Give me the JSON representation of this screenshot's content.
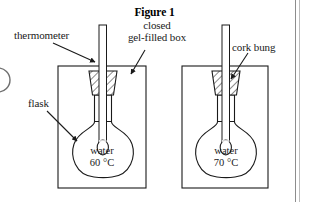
{
  "figure": {
    "title": "Figure 1",
    "type": "science-apparatus-diagram"
  },
  "labels": {
    "thermometer": "thermometer",
    "gel_box_line1": "closed",
    "gel_box_line2": "gel-filled box",
    "cork_bung": "cork bung",
    "flask": "flask"
  },
  "apparatus": [
    {
      "id": "left",
      "contents_label": "water",
      "temperature": "60 °C",
      "box": {
        "x": 58,
        "y": 66,
        "width": 88,
        "height": 122
      }
    },
    {
      "id": "right",
      "contents_label": "water",
      "temperature": "70 °C",
      "box": {
        "x": 182,
        "y": 66,
        "width": 86,
        "height": 122
      }
    }
  ],
  "colors": {
    "stroke": "#1a1a1a",
    "background": "#ffffff",
    "page_rule": "#8d8d8d",
    "hatch": "#333333"
  }
}
